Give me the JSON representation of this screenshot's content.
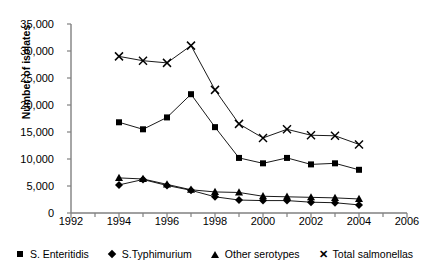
{
  "chart_data": {
    "type": "line",
    "title": "",
    "subtitle": "",
    "xlabel": "",
    "ylabel": "Number of isolates",
    "x": [
      1994,
      1995,
      1996,
      1997,
      1998,
      1999,
      2000,
      2001,
      2002,
      2003,
      2004
    ],
    "xlim": [
      1992,
      2006
    ],
    "ylim": [
      0,
      35000
    ],
    "xticks": [
      1992,
      1994,
      1996,
      1998,
      2000,
      2002,
      2004,
      2006
    ],
    "xtick_labels": [
      "1992",
      "1994",
      "1996",
      "1998",
      "2000",
      "2002",
      "2004",
      "2006"
    ],
    "yticks": [
      0,
      5000,
      10000,
      15000,
      20000,
      25000,
      30000,
      35000
    ],
    "ytick_labels": [
      "0",
      "5,000",
      "10,000",
      "15,000",
      "20,000",
      "25,000",
      "30,000",
      "35,000"
    ],
    "grid": false,
    "legend_position": "bottom",
    "series": [
      {
        "name": "S. Enteritidis",
        "marker": "square",
        "values": [
          16800,
          15500,
          17700,
          22000,
          15900,
          10200,
          9200,
          10200,
          9000,
          9200,
          8000
        ]
      },
      {
        "name": "S.Typhimurium",
        "marker": "diamond",
        "values": [
          5200,
          6200,
          5100,
          4200,
          3000,
          2400,
          2300,
          2300,
          2000,
          1900,
          1500
        ]
      },
      {
        "name": "Other serotypes",
        "marker": "triangle",
        "values": [
          6500,
          6300,
          5300,
          4300,
          3900,
          3800,
          3100,
          3000,
          2900,
          2800,
          2600
        ]
      },
      {
        "name": "Total salmonellas",
        "marker": "cross",
        "values": [
          29000,
          28200,
          27800,
          31000,
          22800,
          16500,
          13900,
          15500,
          14400,
          14300,
          12700
        ]
      }
    ]
  },
  "legend": {
    "items": [
      {
        "label": "S. Enteritidis",
        "marker": "square-marker"
      },
      {
        "label": "S.Typhimurium",
        "marker": "diamond-marker"
      },
      {
        "label": "Other serotypes",
        "marker": "triangle-marker"
      },
      {
        "label": "Total salmonellas",
        "marker": "cross-marker"
      }
    ]
  }
}
